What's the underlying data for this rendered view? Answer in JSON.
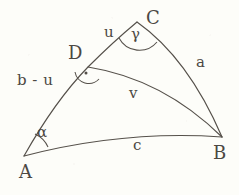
{
  "figure": {
    "type": "spherical-triangle-diagram",
    "background_color": "#fdfdf9",
    "stroke_color": "#55504a",
    "text_color": "#4c4843",
    "width": 239,
    "height": 195,
    "vertices": [
      {
        "id": "A",
        "label": "A",
        "x": 24,
        "y": 156
      },
      {
        "id": "B",
        "label": "B",
        "x": 222,
        "y": 137
      },
      {
        "id": "C",
        "label": "C",
        "x": 137,
        "y": 22
      },
      {
        "id": "D",
        "label": "D",
        "x": 88,
        "y": 67
      }
    ],
    "vertex_labels": [
      {
        "name": "vertex-label-A",
        "text": "A",
        "x": 19,
        "y": 163
      },
      {
        "name": "vertex-label-B",
        "text": "B",
        "x": 213,
        "y": 144
      },
      {
        "name": "vertex-label-C",
        "text": "C",
        "x": 146,
        "y": 9
      },
      {
        "name": "vertex-label-D",
        "text": "D",
        "x": 68,
        "y": 44
      }
    ],
    "side_labels": [
      {
        "name": "side-label-u",
        "text": "u",
        "x": 104,
        "y": 25
      },
      {
        "name": "side-label-a",
        "text": "a",
        "x": 196,
        "y": 55
      },
      {
        "name": "side-label-v",
        "text": "v",
        "x": 129,
        "y": 86
      },
      {
        "name": "side-label-c",
        "text": "c",
        "x": 133,
        "y": 138
      },
      {
        "name": "side-label-b-minus-u",
        "text": "b - u",
        "x": 17,
        "y": 73
      }
    ],
    "angle_labels": [
      {
        "name": "angle-label-alpha",
        "text": "α",
        "x": 37,
        "y": 125
      },
      {
        "name": "angle-label-gamma",
        "text": "γ",
        "x": 131,
        "y": 27
      }
    ],
    "markers": [
      {
        "name": "right-angle-marker-at-D",
        "kind": "right-angle-dot-arc",
        "x": 86,
        "y": 73
      }
    ],
    "arcs": [
      {
        "name": "arc-A-to-C-through-D",
        "sides": [
          "b - u",
          "u"
        ]
      },
      {
        "name": "arc-C-to-B",
        "sides": [
          "a"
        ]
      },
      {
        "name": "arc-A-to-B",
        "sides": [
          "c"
        ]
      },
      {
        "name": "arc-D-to-B",
        "sides": [
          "v"
        ]
      }
    ]
  }
}
